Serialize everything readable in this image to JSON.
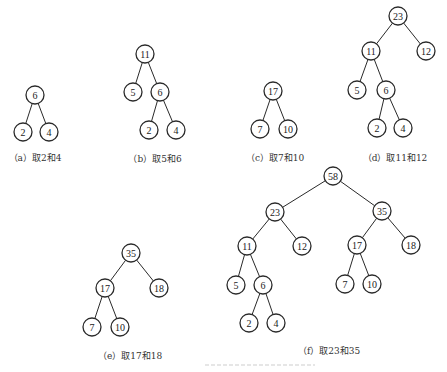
{
  "figure": {
    "node_radius": 9,
    "colors": {
      "stroke": "#2a2a2a",
      "text": "#222222",
      "background": "#ffffff"
    }
  },
  "panels": [
    {
      "id": "a",
      "caption": "（a）取2和4",
      "caption_pos": [
        35,
        157
      ],
      "nodes": [
        {
          "id": "a6",
          "label": "6",
          "x": 35,
          "y": 95
        },
        {
          "id": "a2",
          "label": "2",
          "x": 23,
          "y": 132
        },
        {
          "id": "a4",
          "label": "4",
          "x": 49,
          "y": 132
        }
      ],
      "edges": [
        [
          "a6",
          "a2"
        ],
        [
          "a6",
          "a4"
        ]
      ]
    },
    {
      "id": "b",
      "caption": "（b）取5和6",
      "caption_pos": [
        155,
        158
      ],
      "nodes": [
        {
          "id": "b11",
          "label": "11",
          "x": 145,
          "y": 54
        },
        {
          "id": "b5",
          "label": "5",
          "x": 133,
          "y": 92
        },
        {
          "id": "b6",
          "label": "6",
          "x": 160,
          "y": 92
        },
        {
          "id": "b2",
          "label": "2",
          "x": 149,
          "y": 130
        },
        {
          "id": "b4",
          "label": "4",
          "x": 176,
          "y": 130
        }
      ],
      "edges": [
        [
          "b11",
          "b5"
        ],
        [
          "b11",
          "b6"
        ],
        [
          "b6",
          "b2"
        ],
        [
          "b6",
          "b4"
        ]
      ]
    },
    {
      "id": "c",
      "caption": "（c）取7和10",
      "caption_pos": [
        275,
        157
      ],
      "nodes": [
        {
          "id": "c17",
          "label": "17",
          "x": 273,
          "y": 91
        },
        {
          "id": "c7",
          "label": "7",
          "x": 260,
          "y": 129
        },
        {
          "id": "c10",
          "label": "10",
          "x": 288,
          "y": 129
        }
      ],
      "edges": [
        [
          "c17",
          "c7"
        ],
        [
          "c17",
          "c10"
        ]
      ]
    },
    {
      "id": "d",
      "caption": "（d）取11和12",
      "caption_pos": [
        395,
        157
      ],
      "nodes": [
        {
          "id": "d23",
          "label": "23",
          "x": 398,
          "y": 16
        },
        {
          "id": "d11",
          "label": "11",
          "x": 371,
          "y": 51
        },
        {
          "id": "d12",
          "label": "12",
          "x": 426,
          "y": 51
        },
        {
          "id": "d5",
          "label": "5",
          "x": 357,
          "y": 90
        },
        {
          "id": "d6",
          "label": "6",
          "x": 386,
          "y": 90
        },
        {
          "id": "d2",
          "label": "2",
          "x": 377,
          "y": 128
        },
        {
          "id": "d4",
          "label": "4",
          "x": 403,
          "y": 128
        }
      ],
      "edges": [
        [
          "d23",
          "d11"
        ],
        [
          "d23",
          "d12"
        ],
        [
          "d11",
          "d5"
        ],
        [
          "d11",
          "d6"
        ],
        [
          "d6",
          "d2"
        ],
        [
          "d6",
          "d4"
        ]
      ]
    },
    {
      "id": "e",
      "caption": "（e）取17和18",
      "caption_pos": [
        130,
        355
      ],
      "nodes": [
        {
          "id": "e35",
          "label": "35",
          "x": 131,
          "y": 253
        },
        {
          "id": "e17",
          "label": "17",
          "x": 105,
          "y": 288
        },
        {
          "id": "e18",
          "label": "18",
          "x": 159,
          "y": 288
        },
        {
          "id": "e7",
          "label": "7",
          "x": 92,
          "y": 327
        },
        {
          "id": "e10",
          "label": "10",
          "x": 120,
          "y": 327
        }
      ],
      "edges": [
        [
          "e35",
          "e17"
        ],
        [
          "e35",
          "e18"
        ],
        [
          "e17",
          "e7"
        ],
        [
          "e17",
          "e10"
        ]
      ]
    },
    {
      "id": "f",
      "caption": "（f）取23和35",
      "caption_pos": [
        329,
        350
      ],
      "nodes": [
        {
          "id": "f58",
          "label": "58",
          "x": 333,
          "y": 176
        },
        {
          "id": "f23",
          "label": "23",
          "x": 275,
          "y": 212
        },
        {
          "id": "f35",
          "label": "35",
          "x": 382,
          "y": 211
        },
        {
          "id": "f11",
          "label": "11",
          "x": 247,
          "y": 246
        },
        {
          "id": "f12",
          "label": "12",
          "x": 302,
          "y": 246
        },
        {
          "id": "f17",
          "label": "17",
          "x": 357,
          "y": 245
        },
        {
          "id": "f18",
          "label": "18",
          "x": 411,
          "y": 245
        },
        {
          "id": "f5",
          "label": "5",
          "x": 236,
          "y": 285
        },
        {
          "id": "f6",
          "label": "6",
          "x": 263,
          "y": 285
        },
        {
          "id": "f7",
          "label": "7",
          "x": 345,
          "y": 284
        },
        {
          "id": "f10",
          "label": "10",
          "x": 372,
          "y": 284
        },
        {
          "id": "f2",
          "label": "2",
          "x": 249,
          "y": 323
        },
        {
          "id": "f4",
          "label": "4",
          "x": 276,
          "y": 323
        }
      ],
      "edges": [
        [
          "f58",
          "f23"
        ],
        [
          "f58",
          "f35"
        ],
        [
          "f23",
          "f11"
        ],
        [
          "f23",
          "f12"
        ],
        [
          "f35",
          "f17"
        ],
        [
          "f35",
          "f18"
        ],
        [
          "f11",
          "f5"
        ],
        [
          "f11",
          "f6"
        ],
        [
          "f17",
          "f7"
        ],
        [
          "f17",
          "f10"
        ],
        [
          "f6",
          "f2"
        ],
        [
          "f6",
          "f4"
        ]
      ]
    }
  ]
}
